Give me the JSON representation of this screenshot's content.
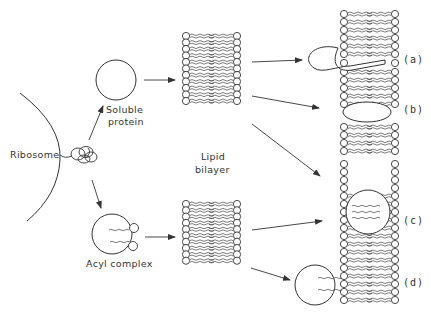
{
  "diagram": {
    "labels": {
      "ribosome": "Ribosome",
      "soluble_protein_line1": "Soluble",
      "soluble_protein_line2": "protein",
      "acyl_complex": "Acyl complex",
      "lipid_bilayer_line1": "Lipid",
      "lipid_bilayer_line2": "bilayer"
    },
    "outcomes": [
      {
        "tag": "(a)",
        "description": "protein partially inserted into bilayer with anchor"
      },
      {
        "tag": "(b)",
        "description": "protein spanning gap between bilayer sections"
      },
      {
        "tag": "(c)",
        "description": "protein embedded within bilayer"
      },
      {
        "tag": "(d)",
        "description": "acyl complex anchored to bilayer surface via acyl chains"
      }
    ],
    "colors": {
      "stroke": "#333333",
      "background": "#ffffff"
    }
  }
}
